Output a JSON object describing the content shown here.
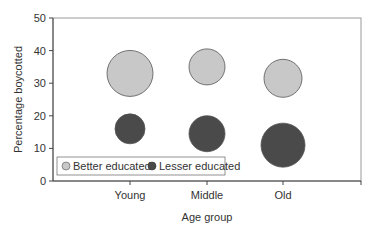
{
  "chart_data": {
    "type": "scatter",
    "subtype": "bubble",
    "title": "",
    "xlabel": "Age group",
    "ylabel": "Percentage boycotted",
    "categories": [
      "Young",
      "Middle",
      "Old"
    ],
    "ylim": [
      0,
      50
    ],
    "yticks": [
      0,
      10,
      20,
      30,
      40,
      50
    ],
    "grid": false,
    "legend_position": "bottom-left inside",
    "series": [
      {
        "name": "Better educated",
        "color": "#c8c8c8",
        "values": [
          33,
          35,
          31.5
        ],
        "sizes": [
          23,
          18,
          19
        ]
      },
      {
        "name": "Lesser educated",
        "color": "#4a4a4a",
        "values": [
          16,
          14.5,
          11
        ],
        "sizes": [
          15,
          18,
          22
        ]
      }
    ]
  }
}
